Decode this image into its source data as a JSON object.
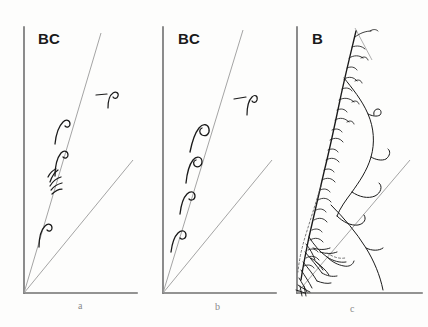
{
  "figure": {
    "background_color": "#fdfdfc",
    "width": 428,
    "height": 327,
    "axis_color": "#6f6f6f",
    "ray_color": "#9a9a9a",
    "ink_color": "#1a1a1a"
  },
  "panels": [
    {
      "id": "a",
      "letter": "a",
      "treatment_label": "BC",
      "label_position": {
        "x": 38,
        "y": 30
      },
      "letter_position": {
        "x": 78,
        "y": 300
      },
      "origin": {
        "x": 24,
        "y": 293
      },
      "axes": {
        "y_axis_top": {
          "x": 24,
          "y": 27
        },
        "x_axis_right": {
          "x": 137,
          "y": 293
        }
      },
      "rays": [
        {
          "name": "steep-ray",
          "from": {
            "x": 24,
            "y": 293
          },
          "to": {
            "x": 101,
            "y": 33
          }
        },
        {
          "name": "shallow-ray",
          "from": {
            "x": 24,
            "y": 293
          },
          "to": {
            "x": 133,
            "y": 160
          }
        }
      ],
      "marks": {
        "type": "crozier-hooks",
        "count": 4,
        "direction": "left-curling",
        "description": "small dark hook-shaped sprout marks along the steep ray"
      },
      "side_symbol": {
        "present": true,
        "position": {
          "x": 100,
          "y": 92
        },
        "description": "small hook glyph with horizontal dash"
      }
    },
    {
      "id": "b",
      "letter": "b",
      "treatment_label": "BC",
      "label_position": {
        "x": 178,
        "y": 30
      },
      "letter_position": {
        "x": 215,
        "y": 301
      },
      "origin": {
        "x": 163,
        "y": 293
      },
      "axes": {
        "y_axis_top": {
          "x": 163,
          "y": 27
        },
        "x_axis_right": {
          "x": 276,
          "y": 293
        }
      },
      "rays": [
        {
          "name": "steep-ray",
          "from": {
            "x": 163,
            "y": 293
          },
          "to": {
            "x": 243,
            "y": 30
          }
        },
        {
          "name": "shallow-ray",
          "from": {
            "x": 163,
            "y": 293
          },
          "to": {
            "x": 272,
            "y": 160
          }
        }
      ],
      "marks": {
        "type": "crozier-hooks",
        "count": 4,
        "direction": "right-curling",
        "description": "small dark hook-shaped sprout marks curling opposite to panel a"
      },
      "side_symbol": {
        "present": true,
        "position": {
          "x": 238,
          "y": 96
        },
        "description": "small hook glyph with horizontal dash"
      }
    },
    {
      "id": "c",
      "letter": "c",
      "treatment_label": "B",
      "label_position": {
        "x": 312,
        "y": 30
      },
      "letter_position": {
        "x": 350,
        "y": 303
      },
      "origin": {
        "x": 297,
        "y": 293
      },
      "axes": {
        "y_axis_top": {
          "x": 297,
          "y": 27
        },
        "x_axis_right": {
          "x": 422,
          "y": 293
        }
      },
      "rays": [
        {
          "name": "shallow-ray",
          "from": {
            "x": 297,
            "y": 293
          },
          "to": {
            "x": 410,
            "y": 160
          }
        }
      ],
      "marks": {
        "type": "dense-feathered-branching",
        "count": 30,
        "direction": "both",
        "description": "dense feathery lateral branchlets along a curved main stem with a large lobed outline lobe and tangled basal cluster"
      },
      "side_symbol": {
        "present": false
      }
    }
  ]
}
